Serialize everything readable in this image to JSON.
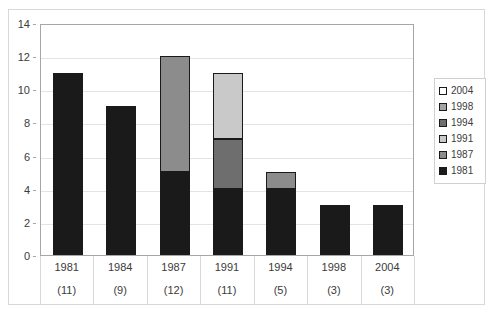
{
  "title_strip": "",
  "chart_data": {
    "type": "bar",
    "subtype": "stacked-column",
    "title": "",
    "xlabel": "",
    "ylabel": "",
    "ylim": [
      0,
      14
    ],
    "ytick_step": 2,
    "yticks": [
      0,
      2,
      4,
      6,
      8,
      10,
      12,
      14
    ],
    "ytick_labels": [
      "0",
      "2",
      "4",
      "6",
      "8",
      "10",
      "12",
      "14"
    ],
    "grid": true,
    "grid_axis": "y",
    "legend_position": "right",
    "categories": [
      "1981",
      "1984",
      "1987",
      "1991",
      "1994",
      "1998",
      "2004"
    ],
    "category_totals": [
      11,
      9,
      12,
      11,
      5,
      3,
      3
    ],
    "category_total_labels": [
      "(11)",
      "(9)",
      "(12)",
      "(11)",
      "(5)",
      "(3)",
      "(3)"
    ],
    "series": [
      {
        "name": "1981",
        "color": "#1a1a1a",
        "values": [
          11,
          9,
          5,
          4,
          4,
          3,
          3
        ]
      },
      {
        "name": "1987",
        "color": "#8c8c8c",
        "values": [
          0,
          0,
          7,
          0,
          1,
          0,
          0
        ]
      },
      {
        "name": "1991",
        "color": "#c9c9c9",
        "values": [
          0,
          0,
          0,
          0,
          0,
          0,
          0
        ]
      },
      {
        "name": "1994",
        "color": "#6e6e6e",
        "values": [
          0,
          0,
          0,
          3,
          0,
          0,
          0
        ]
      },
      {
        "name": "1998",
        "color": "#a3a3a3",
        "values": [
          0,
          0,
          0,
          0,
          0,
          0,
          0
        ]
      },
      {
        "name": "2004",
        "color": "#ffffff",
        "values": [
          0,
          0,
          0,
          4,
          0,
          0,
          0
        ]
      }
    ],
    "stack_order_bottom_to_top": [
      "1981",
      "1987",
      "1994",
      "2004"
    ],
    "bar_stacks": [
      {
        "category": "1981",
        "segments": [
          {
            "series": "1981",
            "value": 11,
            "color": "#1a1a1a"
          }
        ]
      },
      {
        "category": "1984",
        "segments": [
          {
            "series": "1981",
            "value": 9,
            "color": "#1a1a1a"
          }
        ]
      },
      {
        "category": "1987",
        "segments": [
          {
            "series": "1981",
            "value": 5,
            "color": "#1a1a1a"
          },
          {
            "series": "1987",
            "value": 7,
            "color": "#8c8c8c"
          }
        ]
      },
      {
        "category": "1991",
        "segments": [
          {
            "series": "1981",
            "value": 4,
            "color": "#1a1a1a"
          },
          {
            "series": "1994",
            "value": 3,
            "color": "#6e6e6e"
          },
          {
            "series": "1991",
            "value": 4,
            "color": "#c9c9c9"
          }
        ]
      },
      {
        "category": "1994",
        "segments": [
          {
            "series": "1981",
            "value": 4,
            "color": "#1a1a1a"
          },
          {
            "series": "1987",
            "value": 1,
            "color": "#8c8c8c"
          }
        ]
      },
      {
        "category": "1998",
        "segments": [
          {
            "series": "1981",
            "value": 3,
            "color": "#1a1a1a"
          }
        ]
      },
      {
        "category": "2004",
        "segments": [
          {
            "series": "1981",
            "value": 3,
            "color": "#1a1a1a"
          }
        ]
      }
    ]
  },
  "legend": {
    "items": [
      {
        "label": "2004",
        "color": "#ffffff"
      },
      {
        "label": "1998",
        "color": "#a3a3a3"
      },
      {
        "label": "1994",
        "color": "#6e6e6e"
      },
      {
        "label": "1991",
        "color": "#c9c9c9"
      },
      {
        "label": "1987",
        "color": "#8c8c8c"
      },
      {
        "label": "1981",
        "color": "#1a1a1a"
      }
    ]
  }
}
